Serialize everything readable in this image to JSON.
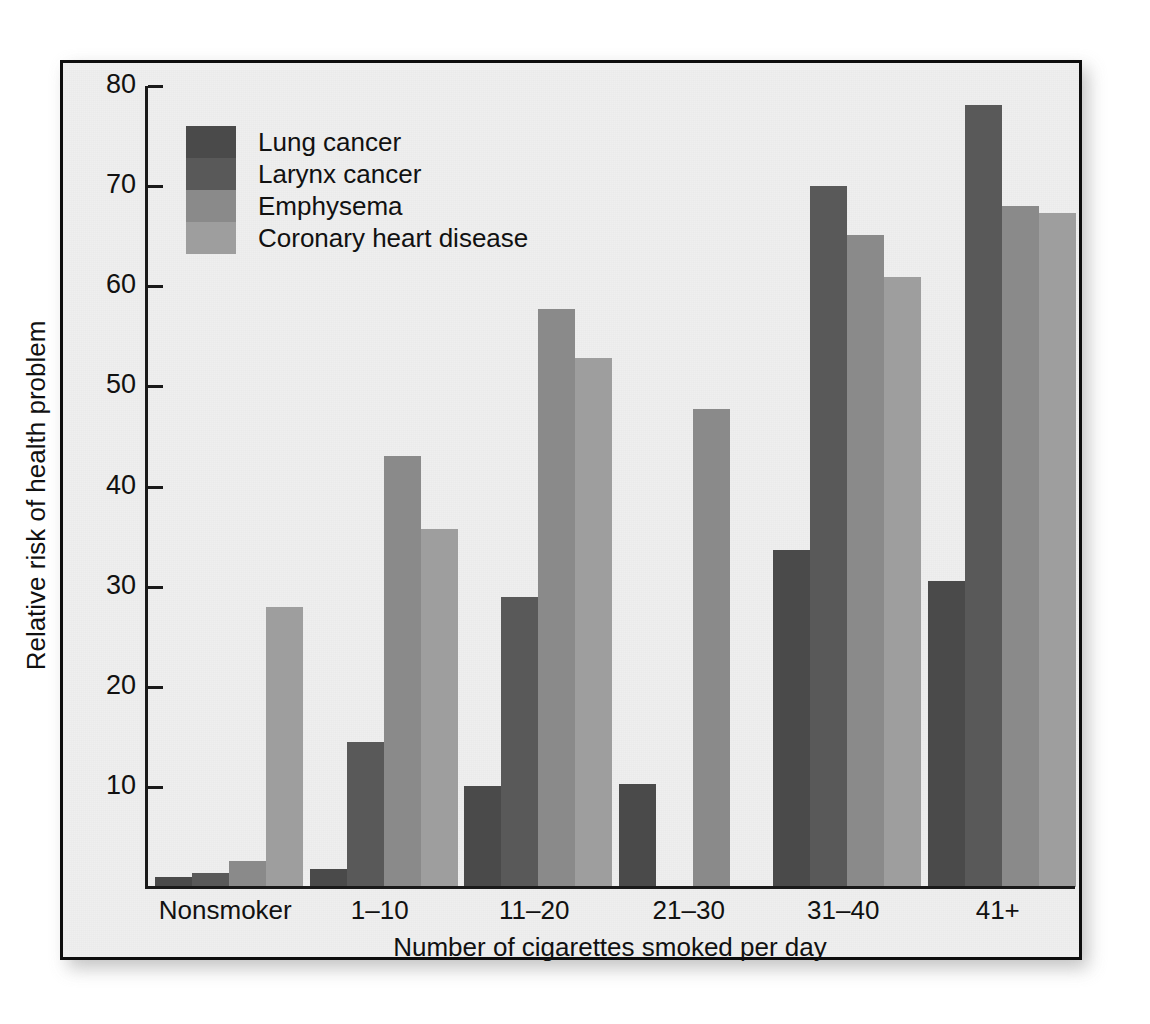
{
  "chart_data": {
    "type": "bar",
    "title": "",
    "xlabel": "Number of cigarettes smoked per day",
    "ylabel": "Relative risk of health problem",
    "categories": [
      "Nonsmoker",
      "1–10",
      "11–20",
      "21–30",
      "31–40",
      "41+"
    ],
    "ylim": [
      0,
      80
    ],
    "yticks": [
      10,
      20,
      30,
      40,
      50,
      60,
      70,
      80
    ],
    "ytick_labels": [
      "10",
      "20",
      "30",
      "40",
      "50",
      "60",
      "70",
      "80"
    ],
    "grid": false,
    "legend_position": "upper-left-inside",
    "series": [
      {
        "name": "Lung cancer",
        "color": "#4a4a4a",
        "values": [
          1.0,
          1.8,
          10.1,
          10.3,
          33.7,
          30.6
        ]
      },
      {
        "name": "Larynx cancer",
        "color": "#595959",
        "values": [
          1.4,
          14.5,
          29.0,
          null,
          70.0,
          78.1
        ]
      },
      {
        "name": "Emphysema",
        "color": "#8a8a8a",
        "values": [
          2.6,
          43.0,
          57.7,
          47.7,
          65.1,
          68.0
        ]
      },
      {
        "name": "Coronary heart disease",
        "color": "#9e9e9e",
        "values": [
          28.0,
          35.8,
          52.8,
          null,
          60.9,
          67.3
        ]
      }
    ]
  },
  "axes": {
    "y_title": "Relative risk of health problem",
    "x_title": "Number of cigarettes smoked per day"
  },
  "legend": {
    "items": [
      {
        "label": "Lung cancer",
        "color": "#4a4a4a"
      },
      {
        "label": "Larynx cancer",
        "color": "#595959"
      },
      {
        "label": "Emphysema",
        "color": "#8a8a8a"
      },
      {
        "label": "Coronary heart disease",
        "color": "#9e9e9e"
      }
    ]
  },
  "colors": {
    "panel_background": "#efefef",
    "frame_border": "#0d0d0d",
    "axis": "#1a1a1a",
    "text": "#111111",
    "page_background": "#ffffff"
  }
}
